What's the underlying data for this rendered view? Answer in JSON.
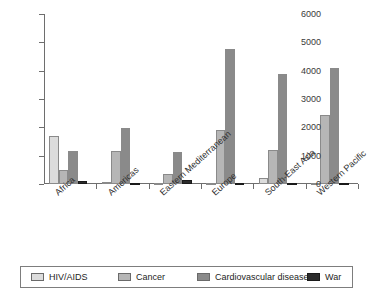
{
  "chart_data": {
    "type": "bar",
    "title": "",
    "subtitle": "",
    "xlabel": "",
    "ylabel": "",
    "ylim": [
      0,
      6000
    ],
    "ytick_interval": 1000,
    "yticks": [
      "0",
      "1000",
      "2000",
      "3000",
      "4000",
      "5000",
      "6000"
    ],
    "grid": false,
    "legend_position": "bottom",
    "categories": [
      "Africa",
      "Americas",
      "Eastern Mediterranean",
      "Europe",
      "South-East Asia",
      "Western Pacific"
    ],
    "series": [
      {
        "name": "HIV/AIDS",
        "color": "#dcdcdc",
        "values": [
          1700,
          60,
          40,
          30,
          200,
          40
        ]
      },
      {
        "name": "Cancer",
        "color": "#b6b6b6",
        "values": [
          480,
          1180,
          350,
          1900,
          1200,
          2420
        ]
      },
      {
        "name": "Cardiovascular diseases",
        "color": "#8a8a8a",
        "values": [
          1180,
          1960,
          1140,
          4780,
          3890,
          4100
        ]
      },
      {
        "name": "War",
        "color": "#2b2b2b",
        "values": [
          120,
          40,
          150,
          30,
          40,
          30
        ]
      }
    ]
  },
  "legend": {
    "entries": [
      {
        "label": "HIV/AIDS",
        "color": "#dcdcdc"
      },
      {
        "label": "Cancer",
        "color": "#b6b6b6"
      },
      {
        "label": "Cardiovascular diseases",
        "color": "#8a8a8a"
      },
      {
        "label": "War",
        "color": "#2b2b2b"
      }
    ]
  },
  "axes": {
    "y_max_label": "6000",
    "y_min_label": "0"
  }
}
